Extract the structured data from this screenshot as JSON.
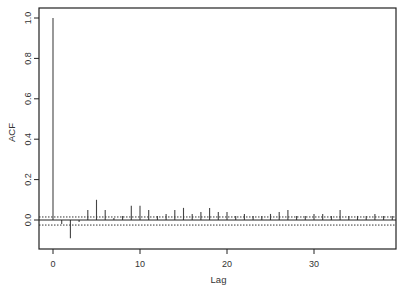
{
  "chart_data": {
    "type": "bar",
    "subtype": "acf-stem",
    "title": "",
    "xlabel": "Lag",
    "ylabel": "ACF",
    "xlim": [
      -1.6,
      39.5
    ],
    "ylim": [
      -0.15,
      1.05
    ],
    "xticks": [
      0,
      10,
      20,
      30
    ],
    "xtick_labels": [
      "0",
      "10",
      "20",
      "30"
    ],
    "yticks": [
      0.0,
      0.2,
      0.4,
      0.6,
      0.8,
      1.0
    ],
    "ytick_labels": [
      "0.0",
      "0.2",
      "0.4",
      "0.6",
      "0.8",
      "1.0"
    ],
    "grid": false,
    "legend": null,
    "confidence_bounds": [
      0.015,
      -0.025
    ],
    "lags": [
      0,
      1,
      2,
      3,
      4,
      5,
      6,
      7,
      8,
      9,
      10,
      11,
      12,
      13,
      14,
      15,
      16,
      17,
      18,
      19,
      20,
      21,
      22,
      23,
      24,
      25,
      26,
      27,
      28,
      29,
      30,
      31,
      32,
      33,
      34,
      35,
      36,
      37,
      38,
      39
    ],
    "values": [
      1.0,
      -0.02,
      -0.09,
      -0.01,
      0.05,
      0.1,
      0.05,
      0.01,
      0.02,
      0.07,
      0.07,
      0.05,
      0.02,
      0.03,
      0.05,
      0.06,
      0.03,
      0.04,
      0.06,
      0.04,
      0.04,
      0.02,
      0.03,
      0.02,
      0.02,
      0.03,
      0.04,
      0.05,
      0.02,
      0.02,
      0.03,
      0.03,
      0.02,
      0.05,
      0.02,
      0.02,
      0.02,
      0.03,
      0.02,
      0.02
    ]
  },
  "colors": {
    "axis": "#222222",
    "stem": "#444444",
    "bound": "#333333",
    "text": "#333333"
  }
}
